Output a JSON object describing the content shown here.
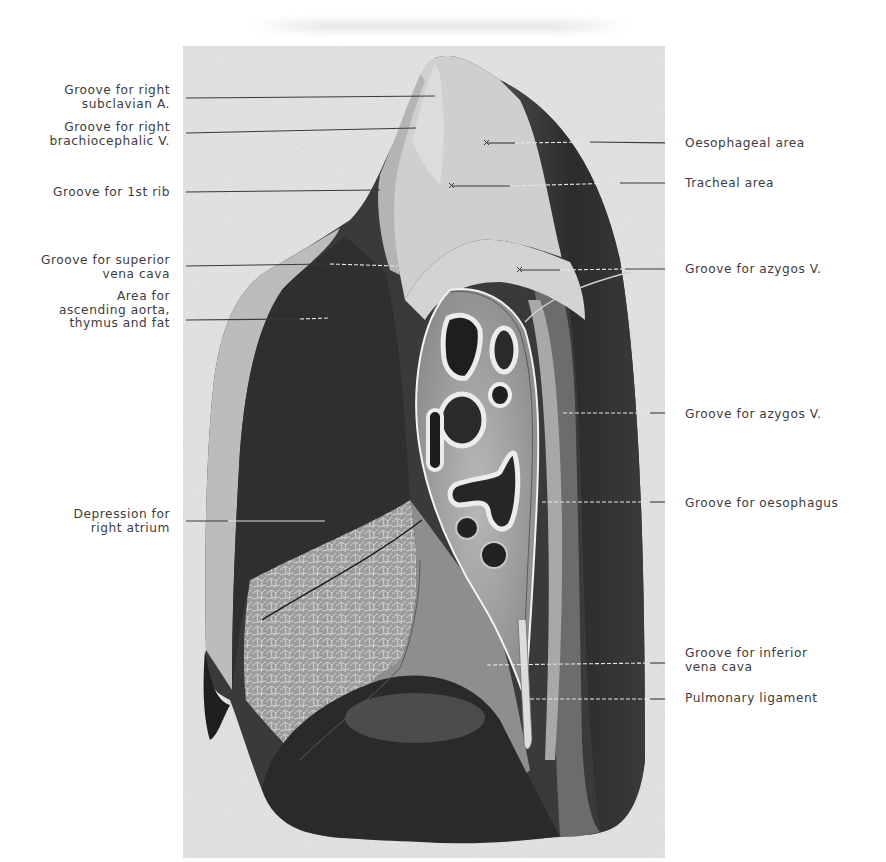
{
  "figure": {
    "type": "anatomical-illustration",
    "palette": {
      "paper": "#ffffff",
      "plate_background": "#e9e9e9",
      "lung_dark": "#2e2e2e",
      "lung_mid": "#777777",
      "lung_light": "#c9c9c9",
      "leader_line": "#3a3a3a",
      "label_text": "#3c3c3c"
    }
  },
  "labels": {
    "left": [
      {
        "id": "subclavian",
        "text_lines": [
          "Groove for right",
          "subclavian A."
        ]
      },
      {
        "id": "brachiocephalic",
        "text_lines": [
          "Groove for right",
          "brachiocephalic V."
        ]
      },
      {
        "id": "first_rib",
        "text_lines": [
          "Groove for 1st rib"
        ]
      },
      {
        "id": "svc",
        "text_lines": [
          "Groove for superior",
          "vena cava"
        ]
      },
      {
        "id": "aorta",
        "text_lines": [
          "Area for",
          "ascending aorta,",
          "thymus and fat"
        ]
      },
      {
        "id": "right_atrium",
        "text_lines": [
          "Depression for",
          "right atrium"
        ]
      }
    ],
    "right": [
      {
        "id": "oesophageal_area",
        "text_lines": [
          "Oesophageal area"
        ]
      },
      {
        "id": "tracheal_area",
        "text_lines": [
          "Tracheal area"
        ]
      },
      {
        "id": "azygos_1",
        "text_lines": [
          "Groove for azygos V."
        ]
      },
      {
        "id": "azygos_2",
        "text_lines": [
          "Groove for azygos V."
        ]
      },
      {
        "id": "oesophagus",
        "text_lines": [
          "Groove for oesophagus"
        ]
      },
      {
        "id": "ivc",
        "text_lines": [
          "Groove for inferior",
          "vena cava"
        ]
      },
      {
        "id": "pulmonary_ligament",
        "text_lines": [
          "Pulmonary ligament"
        ]
      }
    ]
  }
}
